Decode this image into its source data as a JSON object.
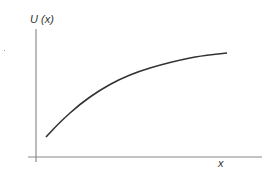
{
  "chart_data": {
    "type": "line",
    "title": "",
    "xlabel": "x",
    "ylabel": "U (x)",
    "grid": false,
    "legend": null,
    "ticks": false,
    "series": [
      {
        "name": "U(x)",
        "color": "#333333",
        "points_px": [
          [
            46,
            137
          ],
          [
            60,
            122
          ],
          [
            80,
            104
          ],
          [
            100,
            90
          ],
          [
            120,
            79
          ],
          [
            140,
            71
          ],
          [
            160,
            65
          ],
          [
            180,
            60
          ],
          [
            200,
            56
          ],
          [
            227,
            53
          ]
        ]
      }
    ]
  },
  "labels": {
    "y_axis": "U (x)",
    "x_axis": "x"
  },
  "colors": {
    "axis": "#666666",
    "curve": "#333333"
  }
}
